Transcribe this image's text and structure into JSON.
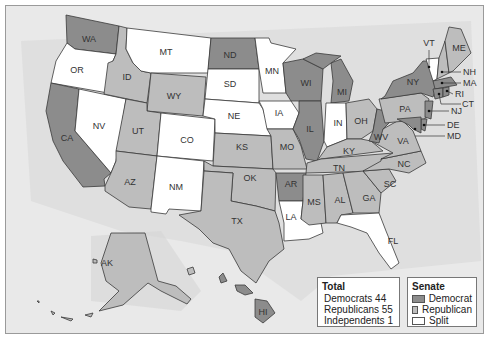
{
  "map": {
    "title": "U.S. Senate by State",
    "colors": {
      "democrat": "#8c8c8c",
      "republican": "#bdbdbd",
      "split": "#ffffff",
      "background": "#e9e9e9"
    },
    "states": [
      {
        "abbr": "WA",
        "party": "democrat"
      },
      {
        "abbr": "OR",
        "party": "split"
      },
      {
        "abbr": "CA",
        "party": "democrat"
      },
      {
        "abbr": "NV",
        "party": "split"
      },
      {
        "abbr": "ID",
        "party": "republican"
      },
      {
        "abbr": "MT",
        "party": "split"
      },
      {
        "abbr": "WY",
        "party": "republican"
      },
      {
        "abbr": "UT",
        "party": "republican"
      },
      {
        "abbr": "AZ",
        "party": "republican"
      },
      {
        "abbr": "CO",
        "party": "split"
      },
      {
        "abbr": "NM",
        "party": "split"
      },
      {
        "abbr": "ND",
        "party": "democrat"
      },
      {
        "abbr": "SD",
        "party": "split"
      },
      {
        "abbr": "NE",
        "party": "split"
      },
      {
        "abbr": "KS",
        "party": "republican"
      },
      {
        "abbr": "OK",
        "party": "republican"
      },
      {
        "abbr": "TX",
        "party": "republican"
      },
      {
        "abbr": "MN",
        "party": "split"
      },
      {
        "abbr": "IA",
        "party": "split"
      },
      {
        "abbr": "MO",
        "party": "republican"
      },
      {
        "abbr": "AR",
        "party": "democrat"
      },
      {
        "abbr": "LA",
        "party": "split"
      },
      {
        "abbr": "WI",
        "party": "democrat"
      },
      {
        "abbr": "IL",
        "party": "democrat"
      },
      {
        "abbr": "MI",
        "party": "democrat"
      },
      {
        "abbr": "IN",
        "party": "split"
      },
      {
        "abbr": "OH",
        "party": "republican"
      },
      {
        "abbr": "KY",
        "party": "republican"
      },
      {
        "abbr": "TN",
        "party": "republican"
      },
      {
        "abbr": "MS",
        "party": "republican"
      },
      {
        "abbr": "AL",
        "party": "republican"
      },
      {
        "abbr": "GA",
        "party": "republican"
      },
      {
        "abbr": "FL",
        "party": "split"
      },
      {
        "abbr": "SC",
        "party": "republican"
      },
      {
        "abbr": "NC",
        "party": "republican"
      },
      {
        "abbr": "VA",
        "party": "republican"
      },
      {
        "abbr": "WV",
        "party": "democrat"
      },
      {
        "abbr": "PA",
        "party": "republican"
      },
      {
        "abbr": "NY",
        "party": "democrat"
      },
      {
        "abbr": "VT",
        "party": "split"
      },
      {
        "abbr": "ME",
        "party": "republican"
      },
      {
        "abbr": "NH",
        "party": "republican"
      },
      {
        "abbr": "MA",
        "party": "democrat"
      },
      {
        "abbr": "RI",
        "party": "democrat"
      },
      {
        "abbr": "CT",
        "party": "democrat"
      },
      {
        "abbr": "NJ",
        "party": "democrat"
      },
      {
        "abbr": "DE",
        "party": "democrat"
      },
      {
        "abbr": "MD",
        "party": "democrat"
      },
      {
        "abbr": "AK",
        "party": "republican"
      },
      {
        "abbr": "HI",
        "party": "democrat"
      }
    ]
  },
  "legend": {
    "total": {
      "title": "Total",
      "rows": [
        "Democrats 44",
        "Republicans 55",
        "Independents 1"
      ]
    },
    "senate": {
      "title": "Senate",
      "items": [
        {
          "label": "Democrat",
          "color": "#8c8c8c"
        },
        {
          "label": "Republican",
          "color": "#bdbdbd"
        },
        {
          "label": "Split",
          "color": "#ffffff"
        }
      ]
    }
  }
}
